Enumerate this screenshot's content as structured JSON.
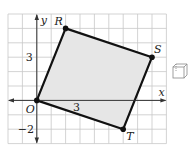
{
  "diagram": {
    "type": "coordinate-plane-figure",
    "grid": {
      "x_min": -2,
      "x_max": 9,
      "y_min": -3,
      "y_max": 6,
      "cell_px": 14.4,
      "origin_px": [
        36.8,
        100.4
      ]
    },
    "axes": {
      "x_label": "x",
      "y_label": "y",
      "origin_label": "O"
    },
    "tick_labels": [
      {
        "text": "3",
        "axis": "y",
        "value": 3
      },
      {
        "text": "−2",
        "axis": "y",
        "value": -2
      },
      {
        "text": "3",
        "axis": "x",
        "value": 3
      }
    ],
    "polygon": {
      "name": "ORST",
      "fill": "#e6e6e6",
      "stroke": "#111111",
      "vertices": [
        {
          "label": "O",
          "x": 0,
          "y": 0
        },
        {
          "label": "R",
          "x": 2,
          "y": 5
        },
        {
          "label": "S",
          "x": 8,
          "y": 3
        },
        {
          "label": "T",
          "x": 6,
          "y": -2
        }
      ]
    },
    "colors": {
      "grid": "#c8c8c8",
      "axis": "#333333",
      "point": "#111111"
    }
  },
  "side_icon": {
    "name": "cube-icon"
  }
}
